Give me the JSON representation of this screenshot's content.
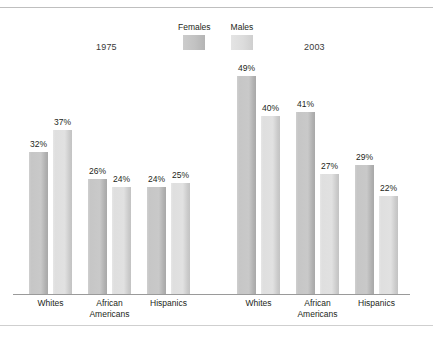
{
  "chart_data": {
    "type": "bar",
    "title": "",
    "subtitle": "",
    "xlabel": "",
    "ylabel": "",
    "ylim": [
      0,
      60
    ],
    "grid": false,
    "legend_position": "top-center",
    "legend": [
      "Females",
      "Males"
    ],
    "series_colors": {
      "Females": "#c6c6c6",
      "Males": "#dfdfdf"
    },
    "panels": [
      {
        "name": "1975",
        "categories": [
          "Whites",
          "African Americans",
          "Hispanics"
        ],
        "series": [
          {
            "name": "Females",
            "values": [
              32,
              37,
              26
            ]
          },
          {
            "name": "Males",
            "values": [
              24,
              24,
              25
            ]
          }
        ]
      },
      {
        "name": "2003",
        "categories": [
          "Whites",
          "African Americans",
          "Hispanics"
        ],
        "series": [
          {
            "name": "Females",
            "values": [
              49,
              41,
              29
            ]
          },
          {
            "name": "Males",
            "values": [
              40,
              27,
              22
            ]
          }
        ]
      }
    ],
    "bars": [
      {
        "panel": "1975",
        "category": "Whites",
        "series": "Females",
        "value": 32,
        "label": "32%"
      },
      {
        "panel": "1975",
        "category": "Whites",
        "series": "Males",
        "value": 37,
        "label": "37%"
      },
      {
        "panel": "1975",
        "category": "African Americans",
        "series": "Females",
        "value": 26,
        "label": "26%"
      },
      {
        "panel": "1975",
        "category": "African Americans",
        "series": "Males",
        "value": 24,
        "label": "24%"
      },
      {
        "panel": "1975",
        "category": "Hispanics",
        "series": "Females",
        "value": 24,
        "label": "24%"
      },
      {
        "panel": "1975",
        "category": "Hispanics",
        "series": "Males",
        "value": 25,
        "label": "25%"
      },
      {
        "panel": "2003",
        "category": "Whites",
        "series": "Females",
        "value": 49,
        "label": "49%"
      },
      {
        "panel": "2003",
        "category": "Whites",
        "series": "Males",
        "value": 40,
        "label": "40%"
      },
      {
        "panel": "2003",
        "category": "African Americans",
        "series": "Females",
        "value": 41,
        "label": "41%"
      },
      {
        "panel": "2003",
        "category": "African Americans",
        "series": "Males",
        "value": 27,
        "label": "27%"
      },
      {
        "panel": "2003",
        "category": "Hispanics",
        "series": "Females",
        "value": 29,
        "label": "29%"
      },
      {
        "panel": "2003",
        "category": "Hispanics",
        "series": "Males",
        "value": 22,
        "label": "22%"
      }
    ]
  },
  "legend": {
    "items": [
      {
        "label": "Females",
        "swatch": "females"
      },
      {
        "label": "Males",
        "swatch": "males"
      }
    ]
  },
  "captions": {
    "left": "1975",
    "right": "2003"
  },
  "category_labels": {
    "whites": "Whites",
    "african_americans": "African\nAmericans",
    "hispanics": "Hispanics"
  }
}
